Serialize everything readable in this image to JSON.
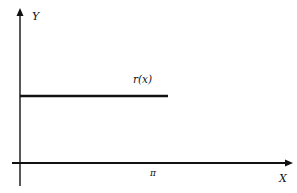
{
  "diagram": {
    "axes": {
      "y_label": "Y",
      "x_label": "X"
    },
    "curve": {
      "label": "r(x)",
      "description": "constant horizontal segment from x=0 to x=pi"
    },
    "ticks": {
      "pi_label": "π"
    },
    "colors": {
      "ink": "#111111",
      "background": "#ffffff"
    }
  }
}
